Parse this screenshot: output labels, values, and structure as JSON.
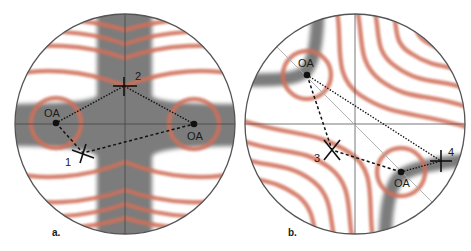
{
  "figure": {
    "panels": [
      {
        "id": "a",
        "label": "a.",
        "optic_axes": [
          {
            "label": "OA",
            "x": 56,
            "y": 123
          },
          {
            "label": "OA",
            "x": 194,
            "y": 124
          }
        ],
        "positions": [
          {
            "label": "1",
            "x": 83,
            "y": 153
          },
          {
            "label": "2",
            "x": 124,
            "y": 86
          }
        ]
      },
      {
        "id": "b",
        "label": "b.",
        "optic_axes": [
          {
            "label": "OA",
            "x": 307,
            "y": 75
          },
          {
            "label": "OA",
            "x": 401,
            "y": 172
          }
        ],
        "positions": [
          {
            "label": "3",
            "x": 332,
            "y": 150
          },
          {
            "label": "4",
            "x": 441,
            "y": 161
          }
        ]
      }
    ],
    "colors": {
      "isogyre": "#7b7b7b",
      "isochrome": "#d0705a",
      "outline": "#555555",
      "crosshair": "#444444",
      "marker": "#111111"
    }
  }
}
